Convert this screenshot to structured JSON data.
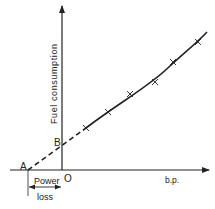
{
  "diagram": {
    "y_axis_label": "Fuel consumption",
    "x_axis_label": "b.p.",
    "origin_label": "O",
    "point_a_label": "A",
    "point_b_label": "B",
    "bracket_label_line1": "Power",
    "bracket_label_line2": "loss",
    "line_color": "#222222",
    "background": "#ffffff",
    "data_points": [
      {
        "x": 86,
        "y": 128
      },
      {
        "x": 108,
        "y": 112
      },
      {
        "x": 130,
        "y": 94
      },
      {
        "x": 155,
        "y": 82
      },
      {
        "x": 173,
        "y": 62
      },
      {
        "x": 198,
        "y": 42
      }
    ]
  }
}
